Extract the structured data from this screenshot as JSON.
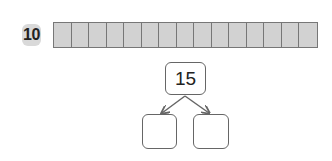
{
  "problem": {
    "number": "10",
    "strip_cells": 15,
    "strip_fill": "#d2d2d2",
    "bond": {
      "whole": "15",
      "part_left": "",
      "part_right": ""
    }
  }
}
